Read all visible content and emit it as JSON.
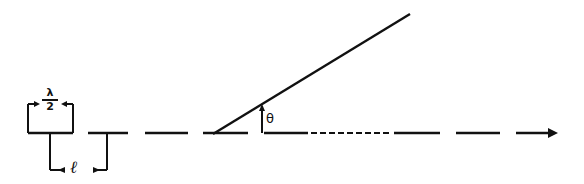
{
  "figure": {
    "labels": {
      "element_length_numerator": "λ",
      "element_length_denominator": "2",
      "spacing": "ℓ",
      "angle": "θ"
    },
    "colors": {
      "stroke": "#111111",
      "background": "#ffffff"
    }
  }
}
